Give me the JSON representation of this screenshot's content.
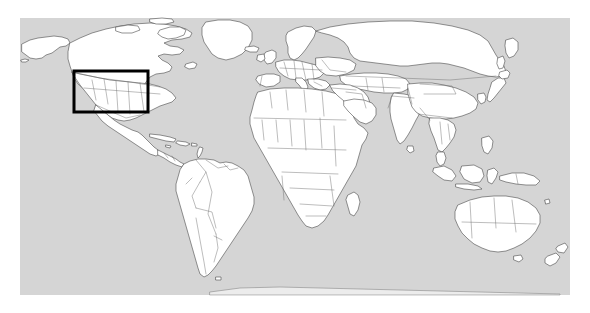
{
  "figure": {
    "type": "world-map",
    "projection": "equirectangular",
    "title": "",
    "caption": "",
    "canvas": {
      "width": 590,
      "height": 313,
      "background": "#ffffff"
    }
  },
  "map": {
    "ocean": {
      "label": "ocean",
      "color": "#d5d5d5",
      "x": 20,
      "y": 18,
      "width": 550,
      "height": 277
    },
    "land": {
      "label": "landmass",
      "fill": "#ffffff",
      "stroke": "#4a4a4a",
      "stroke_width": 0.6
    },
    "borders": {
      "label": "country-borders",
      "stroke": "#6b6b6b",
      "stroke_width": 0.45,
      "visible": true
    },
    "graticule": {
      "visible": false
    },
    "labels": {
      "visible": false
    },
    "extent": {
      "lon_min": -180,
      "lon_max": 180,
      "lat_min": -60,
      "lat_max": 84
    }
  },
  "highlight": {
    "label": "study-area-box",
    "description": "Study area over North America",
    "color": "#000000",
    "stroke_width": 3,
    "fill": "none",
    "x": 74,
    "y": 71,
    "width": 74,
    "height": 41,
    "lon_min": -128,
    "lon_max": -66,
    "lat_min": 24,
    "lat_max": 50
  },
  "regions": [
    {
      "name": "north-america",
      "visible": true
    },
    {
      "name": "south-america",
      "visible": true
    },
    {
      "name": "europe",
      "visible": true
    },
    {
      "name": "africa",
      "visible": true
    },
    {
      "name": "asia",
      "visible": true
    },
    {
      "name": "australia",
      "visible": true
    },
    {
      "name": "greenland",
      "visible": true
    },
    {
      "name": "antarctica-edge",
      "visible": true
    }
  ],
  "chart_data": {
    "type": "map",
    "title": "",
    "xlabel": "",
    "ylabel": "",
    "legend": [],
    "annotations": [
      {
        "kind": "rectangle",
        "label": "study area",
        "lon_range": [
          -128,
          -66
        ],
        "lat_range": [
          24,
          50
        ],
        "color": "#000000"
      }
    ]
  }
}
